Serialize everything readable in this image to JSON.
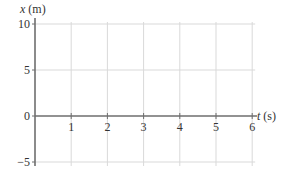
{
  "chart_data": {
    "type": "line",
    "title": "",
    "xlabel": "t (s)",
    "ylabel": "x (m)",
    "xlabel_var": "t",
    "xlabel_unit": " (s)",
    "ylabel_var": "x",
    "ylabel_unit": " (m)",
    "xlim": [
      0,
      6
    ],
    "ylim": [
      -5,
      10
    ],
    "x_ticks": [
      1,
      2,
      3,
      4,
      5,
      6
    ],
    "y_ticks": [
      -5,
      0,
      5,
      10
    ],
    "x_tick_labels": [
      "1",
      "2",
      "3",
      "4",
      "5",
      "6"
    ],
    "y_tick_labels": [
      "−5",
      "0",
      "5",
      "10"
    ],
    "grid": true,
    "series": [],
    "colors": {
      "axis": "#6e6e6e",
      "grid": "#d9d9d9",
      "text": "#333333"
    }
  }
}
